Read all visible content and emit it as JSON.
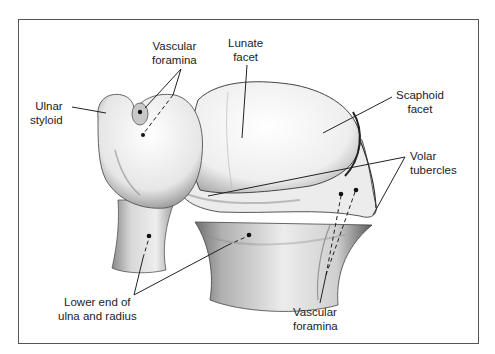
{
  "figure": {
    "frame_color": "#555555",
    "ink_color": "#222222"
  },
  "labels": {
    "vascular_foramina_top": {
      "line1": "Vascular",
      "line2": "foramina"
    },
    "lunate_facet": {
      "line1": "Lunate",
      "line2": "facet"
    },
    "ulnar_styloid": {
      "line1": "Ulnar",
      "line2": "styloid"
    },
    "scaphoid_facet": {
      "line1": "Scaphoid",
      "line2": "facet"
    },
    "volar_tubercles": {
      "line1": "Volar",
      "line2": "tubercles"
    },
    "lower_end": {
      "line1": "Lower end of",
      "line2": "ulna and radius"
    },
    "vascular_foramina_bottom": {
      "line1": "Vascular",
      "line2": "foramina"
    }
  }
}
